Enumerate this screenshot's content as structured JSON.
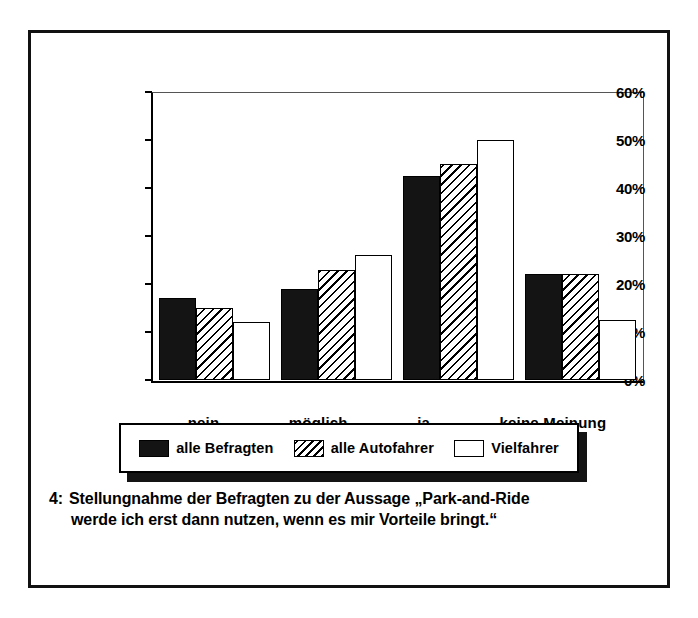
{
  "figure": {
    "caption_number": "4:",
    "caption_line1": "Stellungnahme der Befragten zu der Aussage „Park-and-Ride",
    "caption_line2": "werde ich erst dann nutzen, wenn es mir Vorteile bringt.“"
  },
  "legend": {
    "items": [
      {
        "label": "alle Befragten",
        "swatch": "solid-black-swatch"
      },
      {
        "label": "alle Autofahrer",
        "swatch": "diagonal-hatch-swatch"
      },
      {
        "label": "Vielfahrer",
        "swatch": "white-outline-swatch"
      }
    ]
  },
  "axis": {
    "y_ticks": [
      "0%",
      "10%",
      "20%",
      "30%",
      "40%",
      "50%",
      "60%"
    ]
  },
  "colors": {
    "series_solid": "#141414",
    "series_hatch": "#ffffff",
    "series_white": "#ffffff",
    "frame": "#111111",
    "text": "#000000"
  },
  "chart_data": {
    "type": "bar",
    "title": "",
    "subtitle": "",
    "xlabel": "",
    "ylabel": "",
    "ylim": [
      0,
      60
    ],
    "ytick_values": [
      0,
      10,
      20,
      30,
      40,
      50,
      60
    ],
    "ytick_labels": [
      "0%",
      "10%",
      "20%",
      "30%",
      "40%",
      "50%",
      "60%"
    ],
    "grid": false,
    "legend_position": "below-plot",
    "value_unit": "%",
    "categories": [
      "nein",
      "möglich",
      "ja",
      "keine Meinung"
    ],
    "series": [
      {
        "name": "alle Befragten",
        "values": [
          17,
          19,
          42.5,
          22
        ]
      },
      {
        "name": "alle Autofahrer",
        "values": [
          15,
          23,
          45,
          22
        ]
      },
      {
        "name": "Vielfahrer",
        "values": [
          12,
          26,
          50,
          12.5
        ]
      }
    ]
  }
}
